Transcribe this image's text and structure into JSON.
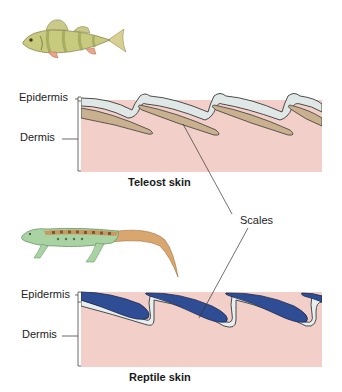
{
  "figure": {
    "teleost": {
      "caption": "Teleost skin",
      "labels": {
        "epidermis": "Epidermis",
        "dermis": "Dermis"
      },
      "organism": "fish-illustration"
    },
    "reptile": {
      "caption": "Reptile skin",
      "labels": {
        "epidermis": "Epidermis",
        "dermis": "Dermis"
      },
      "organism": "lizard-illustration"
    },
    "shared_label": "Scales",
    "colors": {
      "dermis": "#f2cfc8",
      "teleost_scale": "#c9b08e",
      "teleost_epidermis": "#dfe8e6",
      "reptile_scale": "#2f4d94",
      "reptile_epidermis": "#e6efee",
      "outline": "#3a3a3a"
    }
  }
}
